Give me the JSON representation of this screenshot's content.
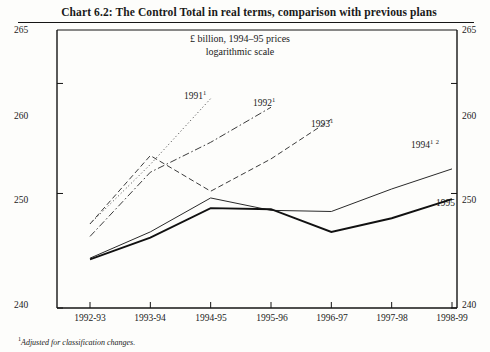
{
  "chart_data": {
    "type": "line",
    "title": "Chart 6.2: The Control Total in real terms, comparison with previous plans",
    "subtitle_line1": "£ billion, 1994–95 prices",
    "subtitle_line2": "logarithmic scale",
    "xlabel": "",
    "ylabel": "",
    "ylim": [
      240,
      265
    ],
    "yscale": "log",
    "ytick_labels": [
      "240",
      "250",
      "260",
      "265"
    ],
    "ytick_values": [
      240,
      250,
      260,
      265
    ],
    "grid": false,
    "legend_position": "inline-annotations",
    "categories": [
      "1992-93",
      "1993-94",
      "1994-95",
      "1995-96",
      "1996-97",
      "1997-98",
      "1998-99"
    ],
    "series": [
      {
        "name": "1991",
        "label": "1991",
        "label_superscript": "1",
        "style": "dotted",
        "x": [
          "1992-93",
          "1993-94",
          "1994-95"
        ],
        "values": [
          247.3,
          252.6,
          258.6
        ]
      },
      {
        "name": "1992",
        "label": "1992",
        "label_superscript": "1",
        "style": "dash-dot",
        "x": [
          "1992-93",
          "1993-94",
          "1994-95",
          "1995-96"
        ],
        "values": [
          246.2,
          251.9,
          254.6,
          257.8
        ]
      },
      {
        "name": "1993",
        "label": "1993",
        "label_superscript": "1",
        "style": "dashed",
        "x": [
          "1992-93",
          "1993-94",
          "1994-95",
          "1995-96",
          "1996-97"
        ],
        "values": [
          247.3,
          253.4,
          250.2,
          253.1,
          256.7
        ]
      },
      {
        "name": "1994",
        "label": "1994",
        "label_superscript": "1 2",
        "style": "solid-thin",
        "x": [
          "1992-93",
          "1993-94",
          "1994-95",
          "1995-96",
          "1996-97",
          "1997-98",
          "1998-99"
        ],
        "values": [
          244.3,
          246.6,
          249.6,
          248.5,
          248.4,
          250.4,
          252.2
        ]
      },
      {
        "name": "1995",
        "label": "1995",
        "label_superscript": "",
        "style": "solid-thick",
        "x": [
          "1992-93",
          "1993-94",
          "1994-95",
          "1995-96",
          "1996-97",
          "1997-98",
          "1998-99"
        ],
        "values": [
          244.2,
          246.1,
          248.7,
          248.6,
          246.6,
          247.8,
          249.5
        ]
      }
    ],
    "footnote_marker": "1",
    "footnote": "Adjusted for classification changes."
  },
  "axis": {
    "left_labels": [
      "265",
      "260",
      "250",
      "240"
    ],
    "right_labels": [
      "265",
      "260",
      "250",
      "240"
    ]
  }
}
